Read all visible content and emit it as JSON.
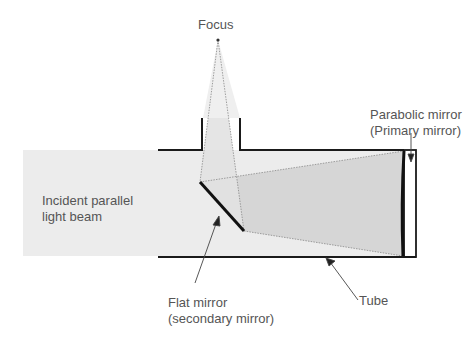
{
  "diagram": {
    "type": "newtonian-telescope-schematic",
    "labels": {
      "focus": "Focus",
      "parabolic_line1": "Parabolic mirror",
      "parabolic_line2": "(Primary mirror)",
      "incident_line1": "Incident parallel",
      "incident_line2": "light beam",
      "flat_line1": "Flat mirror",
      "flat_line2": "(secondary mirror)",
      "tube": "Tube"
    },
    "colors": {
      "beam_fill": "#ececec",
      "converging_fill": "#d6d6d6",
      "line": "#1a1a1a",
      "ray": "#888888",
      "text": "#555555"
    }
  }
}
